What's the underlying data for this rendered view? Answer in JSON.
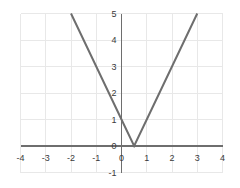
{
  "chart_data": {
    "type": "line",
    "title": "",
    "subtitle": "",
    "xlabel": "",
    "ylabel": "",
    "xlim": [
      -4,
      4
    ],
    "ylim": [
      -1,
      5
    ],
    "grid": true,
    "legend": null,
    "legend_position": "none",
    "x_ticks": [
      "-4",
      "-3",
      "-2",
      "-1",
      "0",
      "1",
      "2",
      "3",
      "4"
    ],
    "x_tick_values": [
      -4,
      -3,
      -2,
      -1,
      0,
      1,
      2,
      3,
      4
    ],
    "y_ticks": [
      "-1",
      "0",
      "1",
      "2",
      "3",
      "4",
      "5"
    ],
    "y_tick_values": [
      -1,
      0,
      1,
      2,
      3,
      4,
      5
    ],
    "series": [
      {
        "name": "y = |2x - 1|",
        "color": "#6e6e6e",
        "linewidth": 2,
        "x": [
          -2,
          0.5,
          3
        ],
        "values": [
          5,
          0,
          5
        ],
        "points": [
          {
            "x": -2,
            "y": 5
          },
          {
            "x": -1,
            "y": 3
          },
          {
            "x": 0,
            "y": 1
          },
          {
            "x": 0.5,
            "y": 0
          },
          {
            "x": 1,
            "y": 1
          },
          {
            "x": 2,
            "y": 3
          },
          {
            "x": 3,
            "y": 5
          }
        ],
        "vertex": {
          "x": 0.5,
          "y": 0
        },
        "y_intercept": 1,
        "x_intercept": 0.5,
        "left_slope": -2,
        "right_slope": 2
      }
    ],
    "annotations": []
  },
  "style": {
    "background": "#ffffff",
    "grid_color": "#e8e8e8",
    "axis_color": "#6e6e6e",
    "tick_text_color": "#3a3a3a",
    "curve_color": "#6e6e6e"
  }
}
